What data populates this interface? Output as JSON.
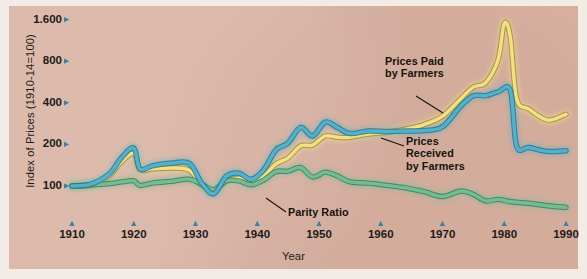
{
  "chart_data": {
    "type": "line",
    "title": "",
    "xlabel": "Year",
    "ylabel": "Index of Prices (1910-14=100)",
    "scale": "log2",
    "xlim": [
      1910,
      1990
    ],
    "ylim": [
      70,
      2000
    ],
    "yticks": [
      100,
      200,
      400,
      800,
      1600
    ],
    "ytick_labels": [
      "100",
      "200",
      "400",
      "800",
      "1.600"
    ],
    "xticks": [
      1910,
      1920,
      1930,
      1940,
      1950,
      1960,
      1970,
      1980,
      1990
    ],
    "xtick_labels": [
      "1910",
      "1920",
      "1930",
      "1940",
      "1950",
      "1960",
      "1970",
      "1980",
      "1990"
    ],
    "grid": false,
    "legend": "annotations",
    "series": [
      {
        "name": "Prices Paid by Farmers",
        "color": "#f5e07f",
        "x": [
          1910,
          1913,
          1916,
          1918,
          1920,
          1921,
          1923,
          1926,
          1929,
          1931,
          1933,
          1935,
          1937,
          1939,
          1941,
          1943,
          1945,
          1947,
          1949,
          1951,
          1953,
          1955,
          1958,
          1961,
          1964,
          1967,
          1970,
          1973,
          1975,
          1977,
          1979,
          1980,
          1981,
          1982,
          1984,
          1987,
          1990
        ],
        "y": [
          100,
          101,
          118,
          150,
          172,
          131,
          133,
          135,
          130,
          102,
          94,
          108,
          114,
          110,
          118,
          144,
          160,
          195,
          198,
          230,
          225,
          225,
          238,
          245,
          258,
          278,
          320,
          430,
          520,
          560,
          820,
          1500,
          1180,
          430,
          360,
          300,
          330
        ]
      },
      {
        "name": "Prices Received by Farmers",
        "color": "#4fb3cf",
        "x": [
          1910,
          1913,
          1916,
          1918,
          1920,
          1921,
          1923,
          1926,
          1929,
          1931,
          1933,
          1935,
          1937,
          1939,
          1941,
          1943,
          1945,
          1947,
          1949,
          1951,
          1953,
          1955,
          1958,
          1961,
          1964,
          1967,
          1970,
          1973,
          1975,
          1977,
          1979,
          1981,
          1982,
          1984,
          1987,
          1990
        ],
        "y": [
          100,
          103,
          122,
          160,
          188,
          133,
          140,
          146,
          146,
          105,
          88,
          118,
          124,
          112,
          130,
          182,
          205,
          265,
          230,
          290,
          265,
          240,
          250,
          248,
          250,
          252,
          268,
          380,
          450,
          450,
          480,
          490,
          195,
          190,
          178,
          180
        ]
      },
      {
        "name": "Parity Ratio",
        "color": "#6fbf94",
        "x": [
          1910,
          1913,
          1916,
          1918,
          1920,
          1921,
          1923,
          1926,
          1929,
          1931,
          1933,
          1935,
          1937,
          1939,
          1941,
          1943,
          1945,
          1947,
          1949,
          1951,
          1953,
          1955,
          1958,
          1961,
          1964,
          1967,
          1970,
          1973,
          1975,
          1977,
          1979,
          1981,
          1984,
          1987,
          1990
        ],
        "y": [
          100,
          102,
          104,
          107,
          109,
          101,
          105,
          108,
          112,
          103,
          94,
          109,
          109,
          102,
          110,
          127,
          128,
          136,
          116,
          126,
          118,
          107,
          105,
          101,
          97,
          91,
          84,
          92,
          87,
          78,
          80,
          77,
          75,
          72,
          70
        ]
      }
    ],
    "annotations": [
      {
        "id": "prices-paid",
        "text_lines": [
          "Prices Paid",
          "by Farmers"
        ],
        "target_series": "Prices Paid by Farmers"
      },
      {
        "id": "prices-received",
        "text_lines": [
          "Prices",
          "Received",
          "by Farmers"
        ],
        "target_series": "Prices Received by Farmers"
      },
      {
        "id": "parity-ratio",
        "text_lines": [
          "Parity Ratio"
        ],
        "target_series": "Parity Ratio"
      }
    ]
  },
  "style": {
    "background": "#d9b3a3",
    "outer_background": "#f3ece6",
    "tick_marker_color": "#3d7fa6",
    "text_color": "#1d1a18"
  }
}
